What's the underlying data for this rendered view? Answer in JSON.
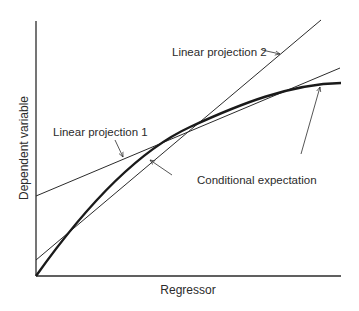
{
  "figure": {
    "xlabel": "Regressor",
    "ylabel": "Dependent variable",
    "annotations": {
      "linear_projection_1": "Linear projection 1",
      "linear_projection_2": "Linear projection 2",
      "conditional_expectation": "Conditional expectation"
    },
    "colors": {
      "line": "#2b2b2b",
      "background": "#ffffff"
    }
  }
}
